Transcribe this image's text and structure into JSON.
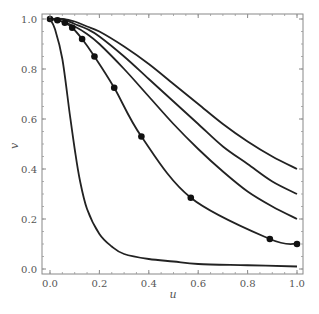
{
  "chart_data": {
    "type": "line",
    "title": "",
    "xlabel": "u",
    "ylabel": "v",
    "xlim": [
      0.0,
      1.0
    ],
    "ylim": [
      0.0,
      1.0
    ],
    "xticks": [
      "0.0",
      "0.2",
      "0.4",
      "0.6",
      "0.8",
      "1.0"
    ],
    "yticks": [
      "0.0",
      "0.2",
      "0.4",
      "0.6",
      "0.8",
      "1.0"
    ],
    "grid": false,
    "legend": null,
    "series": [
      {
        "name": "curve-1",
        "x": [
          0,
          0.05,
          0.1,
          0.15,
          0.2,
          0.3,
          0.4,
          0.5,
          0.6,
          0.7,
          0.8,
          0.9,
          1.0
        ],
        "y": [
          1.0,
          1.0,
          0.99,
          0.97,
          0.95,
          0.89,
          0.82,
          0.74,
          0.66,
          0.58,
          0.51,
          0.45,
          0.4
        ]
      },
      {
        "name": "curve-2",
        "x": [
          0,
          0.05,
          0.1,
          0.15,
          0.2,
          0.3,
          0.4,
          0.5,
          0.6,
          0.7,
          0.8,
          0.9,
          1.0
        ],
        "y": [
          1.0,
          1.0,
          0.98,
          0.96,
          0.93,
          0.85,
          0.76,
          0.67,
          0.58,
          0.49,
          0.42,
          0.35,
          0.3
        ]
      },
      {
        "name": "curve-3",
        "x": [
          0,
          0.05,
          0.1,
          0.15,
          0.2,
          0.3,
          0.4,
          0.5,
          0.6,
          0.7,
          0.8,
          0.9,
          1.0
        ],
        "y": [
          1.0,
          0.99,
          0.97,
          0.94,
          0.9,
          0.8,
          0.69,
          0.58,
          0.48,
          0.39,
          0.31,
          0.25,
          0.2
        ]
      },
      {
        "name": "curve-4-markers",
        "x": [
          0,
          0.03,
          0.06,
          0.09,
          0.13,
          0.18,
          0.26,
          0.37,
          0.57,
          0.89,
          1.0
        ],
        "y": [
          1.0,
          0.995,
          0.985,
          0.965,
          0.92,
          0.85,
          0.725,
          0.53,
          0.285,
          0.12,
          0.1
        ],
        "markers": true
      },
      {
        "name": "curve-5",
        "x": [
          0,
          0.02,
          0.05,
          0.08,
          0.1,
          0.12,
          0.15,
          0.2,
          0.25,
          0.3,
          0.4,
          0.5,
          0.6,
          0.8,
          1.0
        ],
        "y": [
          1.0,
          0.96,
          0.84,
          0.62,
          0.48,
          0.36,
          0.24,
          0.14,
          0.09,
          0.06,
          0.04,
          0.03,
          0.02,
          0.015,
          0.01
        ]
      }
    ]
  }
}
